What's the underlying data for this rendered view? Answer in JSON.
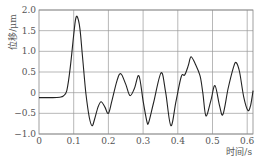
{
  "chart_data": {
    "type": "line",
    "title": "",
    "xlabel": "时间/s",
    "ylabel": "位移/μm",
    "xlim": [
      0,
      0.62
    ],
    "ylim": [
      -1.0,
      2.0
    ],
    "grid": true,
    "legend": null,
    "x_ticks": [
      "0",
      "0.1",
      "0.2",
      "0.3",
      "0.4",
      "0.5",
      "0.6"
    ],
    "y_ticks": [
      "2.0",
      "1.5",
      "1.0",
      "0.5",
      "0",
      "-0.5",
      "-1.0"
    ],
    "series": [
      {
        "name": "displacement",
        "color": "#222222",
        "x": [
          0.0,
          0.02,
          0.04,
          0.06,
          0.07,
          0.08,
          0.09,
          0.1,
          0.105,
          0.11,
          0.118,
          0.125,
          0.135,
          0.145,
          0.153,
          0.16,
          0.17,
          0.179,
          0.19,
          0.2,
          0.21,
          0.225,
          0.236,
          0.25,
          0.262,
          0.275,
          0.288,
          0.3,
          0.311,
          0.316,
          0.33,
          0.352,
          0.365,
          0.38,
          0.395,
          0.41,
          0.42,
          0.43,
          0.438,
          0.45,
          0.464,
          0.472,
          0.481,
          0.495,
          0.507,
          0.52,
          0.53,
          0.545,
          0.56,
          0.568,
          0.578,
          0.59,
          0.602,
          0.61,
          0.617
        ],
        "values": [
          -0.12,
          -0.12,
          -0.12,
          -0.11,
          -0.08,
          0.05,
          0.6,
          1.4,
          1.75,
          1.84,
          1.55,
          0.9,
          0.0,
          -0.6,
          -0.8,
          -0.65,
          -0.35,
          -0.22,
          -0.35,
          -0.5,
          -0.2,
          0.3,
          0.46,
          0.2,
          -0.07,
          0.1,
          0.41,
          -0.2,
          -0.7,
          -0.72,
          -0.25,
          0.48,
          0.0,
          -0.8,
          -0.2,
          0.39,
          0.43,
          0.65,
          0.87,
          0.7,
          0.41,
          0.0,
          -0.56,
          -0.2,
          0.17,
          -0.3,
          -0.53,
          0.1,
          0.6,
          0.73,
          0.5,
          -0.1,
          -0.43,
          -0.3,
          0.05
        ]
      }
    ]
  }
}
